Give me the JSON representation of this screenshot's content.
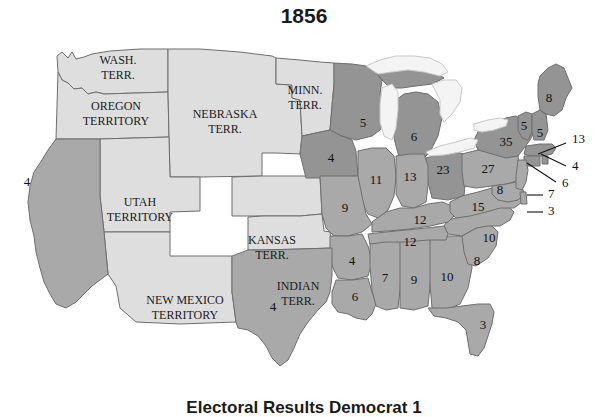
{
  "title": "1856",
  "footer": {
    "caption": "Electoral Results    Democrat 1"
  },
  "colors": {
    "territory": "#dedede",
    "democrat": "#a9a9a9",
    "republican": "#949494",
    "lake": "#f4f4f4",
    "border": "#6e6e6e",
    "text": "#111111",
    "background": "#ffffff"
  },
  "territories": [
    {
      "name": "washington-territory",
      "label_line1": "WASH.",
      "label_line2": "TERR.",
      "x": 118,
      "y": 32,
      "fill": "territory"
    },
    {
      "name": "oregon-territory",
      "label_line1": "OREGON",
      "label_line2": "TERRITORY",
      "x": 116,
      "y": 78,
      "fill": "territory"
    },
    {
      "name": "nebraska-territory",
      "label_line1": "NEBRASKA",
      "label_line2": "TERR.",
      "x": 225,
      "y": 86,
      "fill": "territory"
    },
    {
      "name": "minnesota-territory",
      "label_line1": "MINN.",
      "label_line2": "TERR.",
      "x": 305,
      "y": 62,
      "fill": "territory"
    },
    {
      "name": "utah-territory",
      "label_line1": "UTAH",
      "label_line2": "TERRITORY",
      "x": 140,
      "y": 174,
      "fill": "territory"
    },
    {
      "name": "kansas-territory",
      "label_line1": "KANSAS",
      "label_line2": "TERR.",
      "x": 272,
      "y": 212,
      "fill": "territory"
    },
    {
      "name": "new-mexico-territory",
      "label_line1": "NEW MEXICO",
      "label_line2": "TERRITORY",
      "x": 185,
      "y": 272,
      "fill": "territory"
    },
    {
      "name": "indian-territory",
      "label_line1": "INDIAN",
      "label_line2": "TERR.",
      "x": 298,
      "y": 258,
      "fill": "territory"
    }
  ],
  "chart_data": {
    "type": "map",
    "title": "1856",
    "legend": [
      "Territory",
      "Democrat",
      "Republican"
    ],
    "states": [
      {
        "name": "california",
        "abbr": "CA",
        "electoral_votes": 4,
        "party": "democrat",
        "label_x": 27,
        "label_y": 147
      },
      {
        "name": "iowa",
        "abbr": "IA",
        "electoral_votes": 4,
        "party": "republican",
        "label_x": 331,
        "label_y": 123
      },
      {
        "name": "wisconsin",
        "abbr": "WI",
        "electoral_votes": 5,
        "party": "republican",
        "label_x": 363,
        "label_y": 88
      },
      {
        "name": "michigan",
        "abbr": "MI",
        "electoral_votes": 6,
        "party": "republican",
        "label_x": 414,
        "label_y": 102
      },
      {
        "name": "illinois",
        "abbr": "IL",
        "electoral_votes": 11,
        "party": "democrat",
        "label_x": 376,
        "label_y": 145
      },
      {
        "name": "indiana",
        "abbr": "IN",
        "electoral_votes": 13,
        "party": "democrat",
        "label_x": 410,
        "label_y": 142
      },
      {
        "name": "ohio",
        "abbr": "OH",
        "electoral_votes": 23,
        "party": "republican",
        "label_x": 443,
        "label_y": 135
      },
      {
        "name": "missouri",
        "abbr": "MO",
        "electoral_votes": 9,
        "party": "democrat",
        "label_x": 345,
        "label_y": 173
      },
      {
        "name": "arkansas",
        "abbr": "AR",
        "electoral_votes": 4,
        "party": "democrat",
        "label_x": 352,
        "label_y": 226
      },
      {
        "name": "louisiana",
        "abbr": "LA",
        "electoral_votes": 6,
        "party": "democrat",
        "label_x": 355,
        "label_y": 262
      },
      {
        "name": "texas",
        "abbr": "TX",
        "electoral_votes": 4,
        "party": "democrat",
        "label_x": 273,
        "label_y": 272
      },
      {
        "name": "mississippi",
        "abbr": "MS",
        "electoral_votes": 7,
        "party": "democrat",
        "label_x": 385,
        "label_y": 243
      },
      {
        "name": "alabama",
        "abbr": "AL",
        "electoral_votes": 9,
        "party": "democrat",
        "label_x": 414,
        "label_y": 245
      },
      {
        "name": "georgia",
        "abbr": "GA",
        "electoral_votes": 10,
        "party": "democrat",
        "label_x": 447,
        "label_y": 242
      },
      {
        "name": "florida",
        "abbr": "FL",
        "electoral_votes": 3,
        "party": "democrat",
        "label_x": 483,
        "label_y": 290
      },
      {
        "name": "south-carolina",
        "abbr": "SC",
        "electoral_votes": 8,
        "party": "democrat",
        "label_x": 477,
        "label_y": 226
      },
      {
        "name": "north-carolina",
        "abbr": "NC",
        "electoral_votes": 10,
        "party": "democrat",
        "label_x": 489,
        "label_y": 203
      },
      {
        "name": "tennessee",
        "abbr": "TN",
        "electoral_votes": 12,
        "party": "democrat",
        "label_x": 410,
        "label_y": 207
      },
      {
        "name": "kentucky",
        "abbr": "KY",
        "electoral_votes": 12,
        "party": "democrat",
        "label_x": 420,
        "label_y": 185
      },
      {
        "name": "virginia",
        "abbr": "VA",
        "electoral_votes": 15,
        "party": "democrat",
        "label_x": 478,
        "label_y": 172
      },
      {
        "name": "pennsylvania",
        "abbr": "PA",
        "electoral_votes": 27,
        "party": "democrat",
        "label_x": 488,
        "label_y": 134
      },
      {
        "name": "new-york",
        "abbr": "NY",
        "electoral_votes": 35,
        "party": "republican",
        "label_x": 506,
        "label_y": 107
      },
      {
        "name": "maryland",
        "abbr": "MD",
        "electoral_votes": 8,
        "party": "democrat",
        "label_x": 500,
        "label_y": 155
      },
      {
        "name": "maine",
        "abbr": "ME",
        "electoral_votes": 8,
        "party": "republican",
        "label_x": 549,
        "label_y": 63
      },
      {
        "name": "vermont",
        "abbr": "VT",
        "electoral_votes": 5,
        "party": "republican",
        "label_x": 524,
        "label_y": 91
      },
      {
        "name": "new-hampshire",
        "abbr": "NH",
        "electoral_votes": 5,
        "party": "republican",
        "label_x": 540,
        "label_y": 98
      }
    ],
    "callouts": [
      {
        "name": "massachusetts",
        "abbr": "MA",
        "electoral_votes": 13,
        "party": "republican",
        "label_x": 572,
        "label_y": 104,
        "line": "M 566 107 L 538 118"
      },
      {
        "name": "rhode-island",
        "abbr": "RI",
        "electoral_votes": 4,
        "party": "republican",
        "label_x": 572,
        "label_y": 131,
        "line": "M 566 130 L 541 118"
      },
      {
        "name": "connecticut",
        "abbr": "CT",
        "electoral_votes": 6,
        "party": "republican",
        "label_x": 562,
        "label_y": 148,
        "line": "M 556 146 L 527 127"
      },
      {
        "name": "new-jersey",
        "abbr": "NJ",
        "electoral_votes": 7,
        "party": "democrat",
        "label_x": 548,
        "label_y": 159,
        "line": "M 543 159 L 527 159"
      },
      {
        "name": "delaware",
        "abbr": "DE",
        "electoral_votes": 3,
        "party": "democrat",
        "label_x": 548,
        "label_y": 176,
        "line": "M 543 176 L 527 176"
      }
    ]
  }
}
